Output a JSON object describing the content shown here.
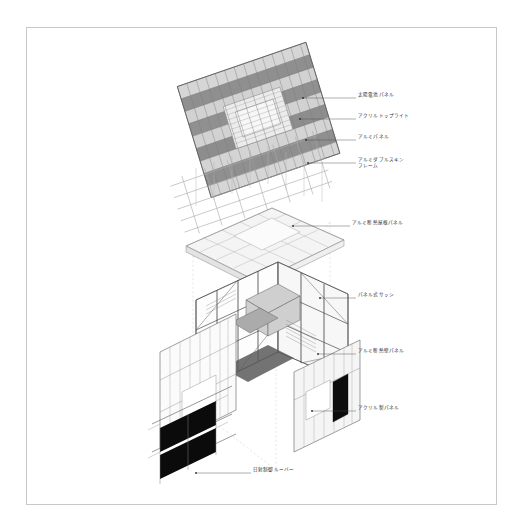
{
  "sheet": {
    "title": "Exploded axonometric construction diagram",
    "background_color": "#ffffff",
    "border_color": "#c9c9c9"
  },
  "annotations": [
    {
      "id": "solar-panel",
      "text": "太陽電池パネル",
      "x": 358,
      "y": 96,
      "leader_from": [
        303,
        98
      ],
      "leader_to": [
        356,
        98
      ]
    },
    {
      "id": "acrylic-toplight",
      "text": "アクリルトップライト",
      "x": 358,
      "y": 117,
      "leader_from": [
        300,
        119
      ],
      "leader_to": [
        356,
        119
      ]
    },
    {
      "id": "aluminum-panel",
      "text": "アルミパネル",
      "x": 358,
      "y": 138,
      "leader_from": [
        306,
        140
      ],
      "leader_to": [
        356,
        140
      ]
    },
    {
      "id": "double-skin-frame",
      "text": "アルミダブルスキン\nフレーム",
      "x": 358,
      "y": 161,
      "leader_from": [
        308,
        163
      ],
      "leader_to": [
        356,
        163
      ]
    },
    {
      "id": "insulated-roof",
      "text": "アルミ断熱屋根パネル",
      "x": 352,
      "y": 224,
      "leader_from": [
        293,
        226
      ],
      "leader_to": [
        350,
        226
      ]
    },
    {
      "id": "panel-sash",
      "text": "パネル式サッシ",
      "x": 358,
      "y": 296,
      "leader_from": [
        320,
        298
      ],
      "leader_to": [
        356,
        298
      ]
    },
    {
      "id": "insulated-wall",
      "text": "アルミ断熱壁パネル",
      "x": 358,
      "y": 352,
      "leader_from": [
        318,
        354
      ],
      "leader_to": [
        356,
        354
      ]
    },
    {
      "id": "acrylic-panel",
      "text": "アクリル製パネル",
      "x": 358,
      "y": 409,
      "leader_from": [
        312,
        411
      ],
      "leader_to": [
        356,
        411
      ]
    },
    {
      "id": "sun-control-louver",
      "text": "日射制御ルーバー",
      "x": 253,
      "y": 471,
      "leader_from": [
        196,
        473
      ],
      "leader_to": [
        251,
        473
      ]
    }
  ],
  "layers": [
    {
      "id": "solar-roof-grid",
      "label": "Solar panel roof grid",
      "color": "#9a9a9a"
    },
    {
      "id": "frame-lattice",
      "label": "Aluminium double skin frame",
      "color": "#bdbdbd"
    },
    {
      "id": "insulated-roof",
      "label": "Insulated roof panel plane",
      "color": "#f2f2f2"
    },
    {
      "id": "building-frame",
      "label": "Building structural frame",
      "color": "#6e6e6e"
    },
    {
      "id": "wall-panels",
      "label": "Wall panel envelope",
      "color": "#ededed"
    },
    {
      "id": "louvers",
      "label": "Solar control louvers",
      "color": "#111111"
    }
  ]
}
